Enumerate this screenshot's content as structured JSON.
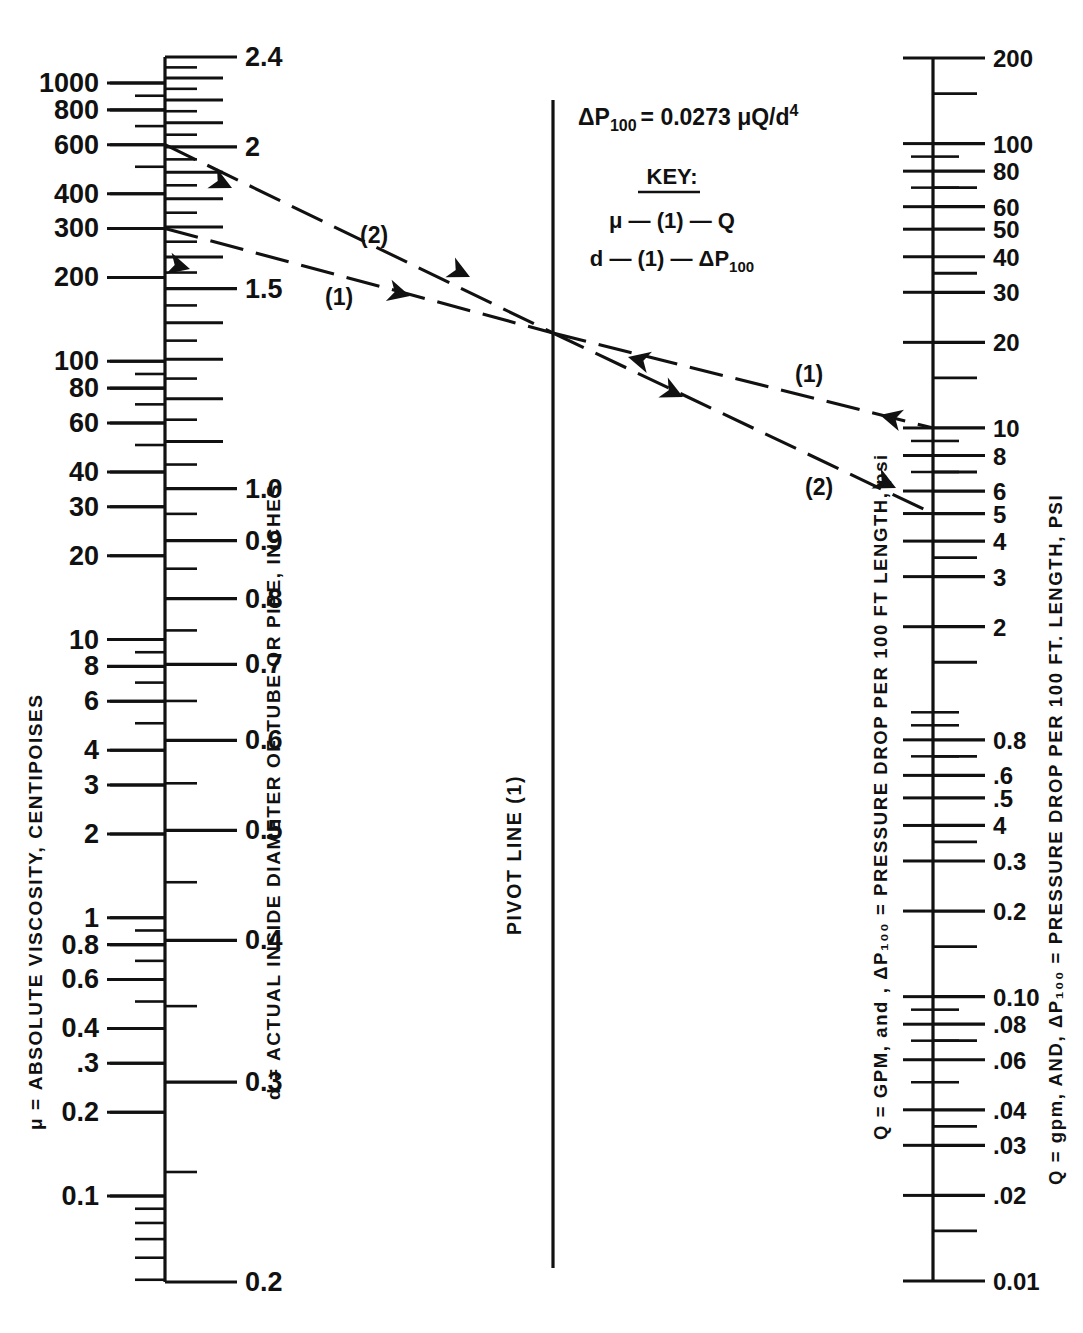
{
  "figure": {
    "type": "nomograph",
    "formula": "ΔP₁₀₀ = 0.0273 μQ/d⁴",
    "formula_parts": {
      "lhs": "ΔP",
      "lhs_sub": "100",
      "eq": "= 0.0273 μQ/d",
      "exp": "4"
    },
    "key": {
      "title": "KEY:",
      "line1": "μ — (1) — Q",
      "line2": "d — (1) — ΔP",
      "line2_sub": "100"
    },
    "pivot_label": "PIVOT LINE (1)",
    "line_labels": {
      "one": "(1)",
      "two": "(2)"
    },
    "ink_color": "#111111",
    "background_color": "#ffffff"
  },
  "axes": {
    "viscosity": {
      "title": "μ = ABSOLUTE VISCOSITY, CENTIPOISES",
      "side": "left-of-left-axis",
      "scale": "log",
      "range": [
        0.08,
        1200
      ],
      "labels": [
        "1000",
        "800",
        "600",
        "400",
        "300",
        "200",
        "100",
        "80",
        "60",
        "40",
        "30",
        "20",
        "10",
        "8",
        "6",
        "4",
        "3",
        "2",
        "1",
        "0.8",
        "0.6",
        "0.4",
        ".3",
        "0.2",
        "0.1"
      ],
      "values": [
        1000,
        800,
        600,
        400,
        300,
        200,
        100,
        80,
        60,
        40,
        30,
        20,
        10,
        8,
        6,
        4,
        3,
        2,
        1,
        0.8,
        0.6,
        0.4,
        0.3,
        0.2,
        0.1
      ]
    },
    "diameter": {
      "title": "d = ACTUAL INSIDE DIAMETER OF TUBE OR PIPE, INCHES",
      "side": "right-of-left-axis",
      "scale": "log",
      "range": [
        0.2,
        2.4
      ],
      "labels": [
        "2.4",
        "2",
        "1.5",
        "1.0",
        "0.9",
        "0.8",
        "0.7",
        "0.6",
        "0.5",
        "0.4",
        "0.3",
        "0.2"
      ],
      "values": [
        2.4,
        2,
        1.5,
        1.0,
        0.9,
        0.8,
        0.7,
        0.6,
        0.5,
        0.4,
        0.3,
        0.2
      ]
    },
    "flow": {
      "title": "Q = GPM, and , ΔP₁₀₀ = PRESSURE DROP PER 100 FT LENGTH, psi",
      "side": "left-of-right-axis",
      "scale": "log",
      "range": [
        0.01,
        200
      ]
    },
    "pressure": {
      "title": "Q = gpm, AND, ΔP₁₀₀ = PRESSURE DROP PER 100 FT. LENGTH, PSI",
      "side": "right-of-right-axis",
      "scale": "log",
      "range": [
        0.01,
        200
      ],
      "labels": [
        "200",
        "100",
        "80",
        "60",
        "50",
        "40",
        "30",
        "20",
        "10",
        "8",
        "6",
        "5",
        "4",
        "3",
        "2",
        "0.8",
        ".6",
        ".5",
        "4",
        "0.3",
        "0.2",
        "0.10",
        ".08",
        ".06",
        ".04",
        ".03",
        ".02",
        "0.01"
      ],
      "values": [
        200,
        100,
        80,
        60,
        50,
        40,
        30,
        20,
        10,
        8,
        6,
        5,
        4,
        3,
        2,
        0.8,
        0.6,
        0.5,
        0.4,
        0.3,
        0.2,
        0.1,
        0.08,
        0.06,
        0.04,
        0.03,
        0.02,
        0.01
      ]
    }
  },
  "chart_data": {
    "type": "line",
    "xlabel": "",
    "ylabel": "",
    "series": [
      {
        "name": "(1)",
        "left_scale": "viscosity",
        "left_value": 300,
        "pivot_crossing": true,
        "right_scale": "pressure",
        "right_value": 10,
        "note": "μ — (1) — Q"
      },
      {
        "name": "(2)",
        "left_scale": "viscosity",
        "left_value": 600,
        "pivot_crossing": true,
        "right_scale": "pressure",
        "right_value": 5,
        "note": "d — (1) — ΔP₁₀₀"
      }
    ],
    "diameter_anchors": {
      "line1_d": 1.5,
      "line2_d": 2.0
    },
    "legend": [
      "(1)",
      "(2)"
    ],
    "grid": false
  }
}
